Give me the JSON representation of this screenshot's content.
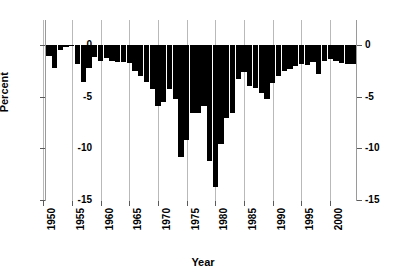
{
  "chart_data": {
    "type": "bar",
    "title": "",
    "subtitle": "",
    "xlabel": "Year",
    "ylabel": "Percent",
    "xlim": [
      1950.5,
      2004.5
    ],
    "ylim": [
      -15,
      0
    ],
    "xticks": [
      1950,
      1955,
      1960,
      1965,
      1970,
      1975,
      1980,
      1985,
      1990,
      1995,
      2000
    ],
    "xtick_labels": [
      "1950",
      "1955",
      "1960",
      "1965",
      "1970",
      "1975",
      "1980",
      "1985",
      "1990",
      "1995",
      "2000"
    ],
    "yticks": [
      0,
      -5,
      -10,
      -15
    ],
    "ytick_labels": [
      "0",
      "-5",
      "-10",
      "-15"
    ],
    "ytick_labels_right": [
      "0",
      "-5",
      "-10",
      "-15"
    ],
    "grid": {
      "vertical": true,
      "horizontal": false
    },
    "legend": null,
    "bar_color": "#000000",
    "grid_color": "#b9b9b9",
    "axis_color": "#9a9a9a",
    "categories": [
      1951,
      1952,
      1953,
      1954,
      1955,
      1956,
      1957,
      1958,
      1959,
      1960,
      1961,
      1962,
      1963,
      1964,
      1965,
      1966,
      1967,
      1968,
      1969,
      1970,
      1971,
      1972,
      1973,
      1974,
      1975,
      1976,
      1977,
      1978,
      1979,
      1980,
      1981,
      1982,
      1983,
      1984,
      1985,
      1986,
      1987,
      1988,
      1989,
      1990,
      1991,
      1992,
      1993,
      1994,
      1995,
      1996,
      1997,
      1998,
      1999,
      2000,
      2001,
      2002,
      2003,
      2004
    ],
    "values": [
      -1.1,
      -2.2,
      -0.5,
      -0.2,
      -0.1,
      -1.8,
      -3.6,
      -2.2,
      -1.2,
      -1.5,
      -1.3,
      -1.5,
      -1.6,
      -1.6,
      -1.7,
      -2.5,
      -3.0,
      -3.6,
      -4.3,
      -5.9,
      -5.5,
      -4.3,
      -5.2,
      -10.8,
      -9.2,
      -6.6,
      -6.6,
      -5.9,
      -11.2,
      -13.7,
      -9.6,
      -7.1,
      -6.6,
      -3.3,
      -2.6,
      -4.0,
      -4.2,
      -4.6,
      -5.2,
      -3.7,
      -3.0,
      -2.5,
      -2.3,
      -2.0,
      -1.8,
      -1.9,
      -1.6,
      -2.8,
      -1.5,
      -1.4,
      -1.5,
      -1.7,
      -1.8,
      -1.8
    ]
  },
  "axes": {
    "y_title": "Percent",
    "x_title": "Year"
  }
}
